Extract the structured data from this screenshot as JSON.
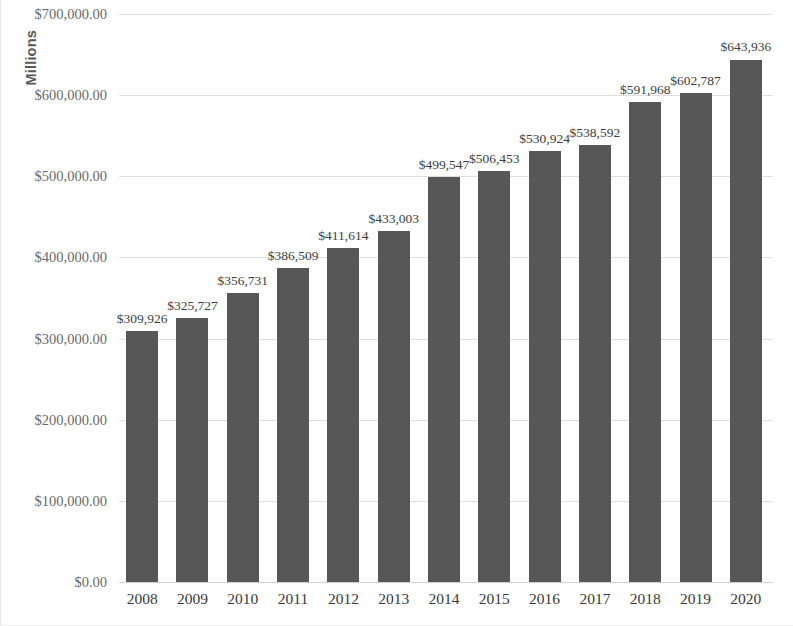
{
  "chart_data": {
    "type": "bar",
    "title": "",
    "subtitle": "",
    "xlabel": "",
    "ylabel": "Millions",
    "ylim": [
      0,
      700000
    ],
    "ytick_step": 100000,
    "ytick_labels": [
      "$700,000.00",
      "$600,000.00",
      "$500,000.00",
      "$400,000.00",
      "$300,000.00",
      "$200,000.00",
      "$100,000.00",
      "$0.00"
    ],
    "ytick_values": [
      700000,
      600000,
      500000,
      400000,
      300000,
      200000,
      100000,
      0
    ],
    "categories": [
      "2008",
      "2009",
      "2010",
      "2011",
      "2012",
      "2013",
      "2014",
      "2015",
      "2016",
      "2017",
      "2018",
      "2019",
      "2020"
    ],
    "values": [
      309926,
      325727,
      356731,
      386509,
      411614,
      433003,
      499547,
      506453,
      530924,
      538592,
      591968,
      602787,
      643936
    ],
    "data_labels": [
      "$309,926",
      "$325,727",
      "$356,731",
      "$386,509",
      "$411,614",
      "$433,003",
      "$499,547",
      "$506,453",
      "$530,924",
      "$538,592",
      "$591,968",
      "$602,787",
      "$643,936"
    ],
    "grid": true,
    "grid_axis": "y",
    "legend": false,
    "legend_position": "none",
    "bar_color": "#575757",
    "gridline_color": "#dfdfdf",
    "label_color": "#3d3d3d",
    "axis_text_color": "#6a6a6a",
    "background_color": "#ffffff"
  }
}
